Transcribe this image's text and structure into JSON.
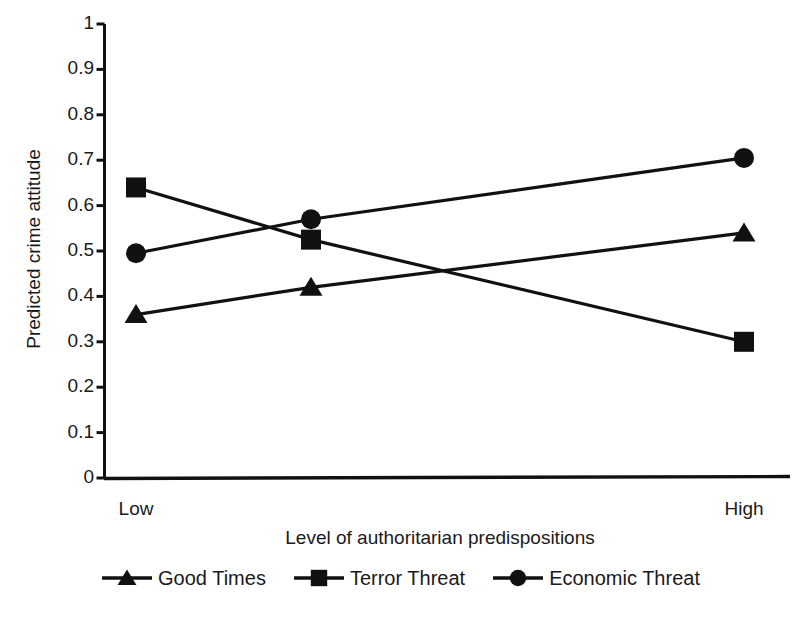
{
  "chart_data": {
    "type": "line",
    "title": "",
    "xlabel": "Level of authoritarian predispositions",
    "ylabel": "Predicted crime attitude",
    "categories": [
      "Low",
      "",
      "High"
    ],
    "x_tick_labels": [
      "Low",
      "High"
    ],
    "y_tick_labels": [
      "1",
      "0.9",
      "0.8",
      "0.7",
      "0.6",
      "0.5",
      "0.4",
      "0.3",
      "0.2",
      "0.1",
      "0"
    ],
    "y_ticks": [
      1,
      0.9,
      0.8,
      0.7,
      0.6,
      0.5,
      0.4,
      0.3,
      0.2,
      0.1,
      0
    ],
    "ylim": [
      0,
      1
    ],
    "xlim": [
      0,
      2
    ],
    "grid": false,
    "legend_position": "bottom",
    "series": [
      {
        "name": "Good Times",
        "marker": "triangle",
        "color": "#111111",
        "values": [
          0.36,
          0.42,
          0.54
        ]
      },
      {
        "name": "Terror Threat",
        "marker": "square",
        "color": "#111111",
        "values": [
          0.64,
          0.525,
          0.3
        ]
      },
      {
        "name": "Economic Threat",
        "marker": "circle",
        "color": "#111111",
        "values": [
          0.495,
          0.57,
          0.705
        ]
      }
    ]
  },
  "axes": {
    "y_title": "Predicted crime attitude",
    "x_title": "Level of authoritarian predispositions",
    "y_labels": [
      "1",
      "0.9",
      "0.8",
      "0.7",
      "0.6",
      "0.5",
      "0.4",
      "0.3",
      "0.2",
      "0.1",
      "0"
    ],
    "x_labels": [
      "Low",
      "High"
    ]
  },
  "legend": {
    "items": [
      {
        "label": "Good Times",
        "marker": "triangle-marker-icon"
      },
      {
        "label": "Terror Threat",
        "marker": "square-marker-icon"
      },
      {
        "label": "Economic Threat",
        "marker": "circle-marker-icon"
      }
    ]
  }
}
